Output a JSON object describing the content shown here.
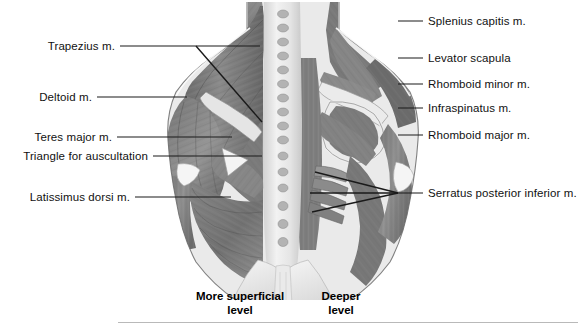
{
  "figure": {
    "background_color": "#ffffff",
    "line_color": "#1a1a1a",
    "text_color": "#111111"
  },
  "labels_left": [
    {
      "text": "Trapezius m.",
      "y": 46,
      "text_right_x": 115,
      "line_from_x": 120,
      "line_to_x": 260
    },
    {
      "text": "Deltoid m.",
      "y": 97,
      "text_right_x": 92,
      "line_from_x": 97,
      "line_to_x": 187
    },
    {
      "text": "Teres major m.",
      "y": 137,
      "text_right_x": 112,
      "line_from_x": 117,
      "line_to_x": 232
    },
    {
      "text": "Triangle for auscultation",
      "y": 156,
      "text_right_x": 148,
      "line_from_x": 153,
      "line_to_x": 262
    },
    {
      "text": "Latissimus dorsi m.",
      "y": 197,
      "text_right_x": 130,
      "line_from_x": 135,
      "line_to_x": 231
    }
  ],
  "labels_right": [
    {
      "text": "Splenius capitis m.",
      "y": 21,
      "text_left_x": 428,
      "line_from_x": 398,
      "line_to_x": 423
    },
    {
      "text": "Levator scapula",
      "y": 58,
      "text_left_x": 428,
      "line_from_x": 398,
      "line_to_x": 423
    },
    {
      "text": "Rhomboid minor m.",
      "y": 84,
      "text_left_x": 428,
      "line_from_x": 398,
      "line_to_x": 423
    },
    {
      "text": "Infraspinatus m.",
      "y": 108,
      "text_left_x": 428,
      "line_from_x": 398,
      "line_to_x": 423
    },
    {
      "text": "Rhomboid major m.",
      "y": 135,
      "text_left_x": 428,
      "line_from_x": 398,
      "line_to_x": 423
    },
    {
      "text": "Serratus posterior inferior m.",
      "y": 193,
      "text_left_x": 428,
      "line_from_x": 398,
      "line_to_x": 423
    }
  ],
  "captions": [
    {
      "line1": "More superficial",
      "line2": "level",
      "center_x": 240,
      "y": 296
    },
    {
      "line1": "Deeper",
      "line2": "level",
      "center_x": 341,
      "y": 296
    }
  ],
  "rule": {
    "x": 118,
    "y": 322,
    "width": 460
  }
}
